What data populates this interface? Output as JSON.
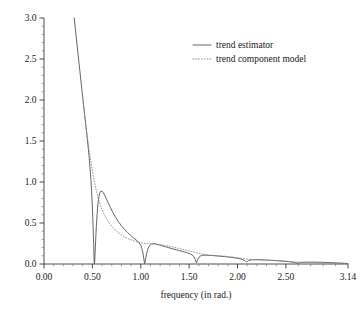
{
  "chart_data": {
    "type": "line",
    "title": "",
    "subtitle": "",
    "xlabel": "frequency (in rad.)",
    "ylabel": "",
    "xlim": [
      0.0,
      3.14159
    ],
    "ylim": [
      0.0,
      3.0
    ],
    "grid": false,
    "legend_position": "top-right",
    "xticks": [
      0.0,
      0.5,
      1.0,
      1.5,
      2.0,
      2.5,
      3.14159
    ],
    "xtick_labels": [
      "0.00",
      "0.50",
      "1.00",
      "1.50",
      "2.00",
      "2.50",
      "3.14"
    ],
    "yticks": [
      0.0,
      0.5,
      1.0,
      1.5,
      2.0,
      2.5,
      3.0
    ],
    "ytick_labels": [
      "0.0",
      "0.5",
      "1.0",
      "1.5",
      "2.0",
      "2.5",
      "3.0"
    ],
    "x_minor_tick_count": 4,
    "y_minor_tick_count": 4,
    "series": [
      {
        "name": "trend estimator",
        "style": "solid",
        "color": "#4a4a4a",
        "points": [
          [
            0.312,
            3.0
          ],
          [
            0.33,
            2.8
          ],
          [
            0.35,
            2.58
          ],
          [
            0.37,
            2.36
          ],
          [
            0.39,
            2.14
          ],
          [
            0.41,
            1.93
          ],
          [
            0.425,
            1.77
          ],
          [
            0.44,
            1.61
          ],
          [
            0.455,
            1.44
          ],
          [
            0.465,
            1.32
          ],
          [
            0.475,
            1.18
          ],
          [
            0.485,
            1.02
          ],
          [
            0.492,
            0.88
          ],
          [
            0.499,
            0.72
          ],
          [
            0.504,
            0.57
          ],
          [
            0.509,
            0.4
          ],
          [
            0.513,
            0.25
          ],
          [
            0.516,
            0.12
          ],
          [
            0.519,
            0.03
          ],
          [
            0.521,
            0.005
          ],
          [
            0.524,
            0.035
          ],
          [
            0.528,
            0.13
          ],
          [
            0.534,
            0.29
          ],
          [
            0.541,
            0.46
          ],
          [
            0.549,
            0.615
          ],
          [
            0.558,
            0.74
          ],
          [
            0.568,
            0.825
          ],
          [
            0.578,
            0.872
          ],
          [
            0.59,
            0.89
          ],
          [
            0.602,
            0.886
          ],
          [
            0.614,
            0.868
          ],
          [
            0.628,
            0.838
          ],
          [
            0.645,
            0.795
          ],
          [
            0.665,
            0.742
          ],
          [
            0.688,
            0.685
          ],
          [
            0.712,
            0.628
          ],
          [
            0.74,
            0.57
          ],
          [
            0.77,
            0.515
          ],
          [
            0.8,
            0.466
          ],
          [
            0.832,
            0.422
          ],
          [
            0.865,
            0.382
          ],
          [
            0.898,
            0.346
          ],
          [
            0.93,
            0.314
          ],
          [
            0.96,
            0.285
          ],
          [
            0.985,
            0.256
          ],
          [
            1.0,
            0.228
          ],
          [
            1.01,
            0.196
          ],
          [
            1.018,
            0.16
          ],
          [
            1.025,
            0.118
          ],
          [
            1.031,
            0.07
          ],
          [
            1.036,
            0.028
          ],
          [
            1.04,
            0.006
          ],
          [
            1.045,
            0.028
          ],
          [
            1.052,
            0.078
          ],
          [
            1.062,
            0.135
          ],
          [
            1.075,
            0.188
          ],
          [
            1.09,
            0.224
          ],
          [
            1.108,
            0.243
          ],
          [
            1.128,
            0.248
          ],
          [
            1.15,
            0.245
          ],
          [
            1.18,
            0.236
          ],
          [
            1.215,
            0.224
          ],
          [
            1.255,
            0.21
          ],
          [
            1.3,
            0.195
          ],
          [
            1.345,
            0.18
          ],
          [
            1.39,
            0.166
          ],
          [
            1.435,
            0.152
          ],
          [
            1.475,
            0.138
          ],
          [
            1.51,
            0.124
          ],
          [
            1.535,
            0.108
          ],
          [
            1.551,
            0.086
          ],
          [
            1.562,
            0.058
          ],
          [
            1.57,
            0.03
          ],
          [
            1.575,
            0.014
          ],
          [
            1.581,
            0.03
          ],
          [
            1.59,
            0.058
          ],
          [
            1.602,
            0.082
          ],
          [
            1.618,
            0.098
          ],
          [
            1.638,
            0.106
          ],
          [
            1.665,
            0.108
          ],
          [
            1.7,
            0.106
          ],
          [
            1.745,
            0.103
          ],
          [
            1.795,
            0.098
          ],
          [
            1.85,
            0.092
          ],
          [
            1.905,
            0.085
          ],
          [
            1.96,
            0.077
          ],
          [
            2.01,
            0.068
          ],
          [
            2.045,
            0.058
          ],
          [
            2.068,
            0.046
          ],
          [
            2.082,
            0.034
          ],
          [
            2.092,
            0.026
          ],
          [
            2.1,
            0.031
          ],
          [
            2.112,
            0.04
          ],
          [
            2.13,
            0.047
          ],
          [
            2.155,
            0.051
          ],
          [
            2.19,
            0.053
          ],
          [
            2.235,
            0.052
          ],
          [
            2.29,
            0.049
          ],
          [
            2.35,
            0.045
          ],
          [
            2.41,
            0.04
          ],
          [
            2.47,
            0.035
          ],
          [
            2.525,
            0.029
          ],
          [
            2.57,
            0.023
          ],
          [
            2.6,
            0.016
          ],
          [
            2.618,
            0.01
          ],
          [
            2.635,
            0.014
          ],
          [
            2.66,
            0.019
          ],
          [
            2.7,
            0.022
          ],
          [
            2.755,
            0.023
          ],
          [
            2.82,
            0.022
          ],
          [
            2.89,
            0.02
          ],
          [
            2.96,
            0.017
          ],
          [
            3.03,
            0.013
          ],
          [
            3.09,
            0.009
          ],
          [
            3.14159,
            0.006
          ]
        ]
      },
      {
        "name": "trend component model",
        "style": "dotted",
        "color": "#8a8a8a",
        "points": [
          [
            0.405,
            1.96
          ],
          [
            0.42,
            1.81
          ],
          [
            0.435,
            1.665
          ],
          [
            0.45,
            1.53
          ],
          [
            0.465,
            1.4
          ],
          [
            0.48,
            1.282
          ],
          [
            0.495,
            1.172
          ],
          [
            0.51,
            1.072
          ],
          [
            0.525,
            0.98
          ],
          [
            0.54,
            0.898
          ],
          [
            0.556,
            0.822
          ],
          [
            0.572,
            0.756
          ],
          [
            0.59,
            0.694
          ],
          [
            0.61,
            0.636
          ],
          [
            0.632,
            0.582
          ],
          [
            0.656,
            0.532
          ],
          [
            0.682,
            0.487
          ],
          [
            0.71,
            0.446
          ],
          [
            0.74,
            0.41
          ],
          [
            0.772,
            0.378
          ],
          [
            0.806,
            0.35
          ],
          [
            0.842,
            0.325
          ],
          [
            0.88,
            0.303
          ],
          [
            0.92,
            0.285
          ],
          [
            0.962,
            0.27
          ],
          [
            1.005,
            0.258
          ],
          [
            1.05,
            0.249
          ],
          [
            1.095,
            0.245
          ],
          [
            1.14,
            0.243
          ],
          [
            1.185,
            0.238
          ],
          [
            1.23,
            0.23
          ],
          [
            1.28,
            0.22
          ],
          [
            1.33,
            0.207
          ],
          [
            1.382,
            0.193
          ],
          [
            1.435,
            0.178
          ],
          [
            1.488,
            0.163
          ],
          [
            1.54,
            0.148
          ],
          [
            1.59,
            0.133
          ],
          [
            1.64,
            0.12
          ],
          [
            1.692,
            0.11
          ],
          [
            1.745,
            0.104
          ],
          [
            1.8,
            0.1
          ],
          [
            1.855,
            0.096
          ],
          [
            1.91,
            0.09
          ],
          [
            1.965,
            0.083
          ],
          [
            2.02,
            0.074
          ],
          [
            2.07,
            0.065
          ],
          [
            2.12,
            0.058
          ],
          [
            2.172,
            0.053
          ],
          [
            2.225,
            0.05
          ],
          [
            2.28,
            0.048
          ],
          [
            2.34,
            0.045
          ],
          [
            2.4,
            0.041
          ],
          [
            2.46,
            0.037
          ],
          [
            2.52,
            0.032
          ],
          [
            2.58,
            0.027
          ],
          [
            2.64,
            0.022
          ],
          [
            2.7,
            0.019
          ],
          [
            2.76,
            0.017
          ],
          [
            2.82,
            0.015
          ],
          [
            2.88,
            0.013
          ],
          [
            2.94,
            0.011
          ],
          [
            3.0,
            0.009
          ],
          [
            3.06,
            0.007
          ],
          [
            3.14159,
            0.005
          ]
        ]
      }
    ],
    "legend": [
      {
        "label": "trend estimator",
        "style": "solid"
      },
      {
        "label": "trend component model",
        "style": "dotted"
      }
    ]
  }
}
